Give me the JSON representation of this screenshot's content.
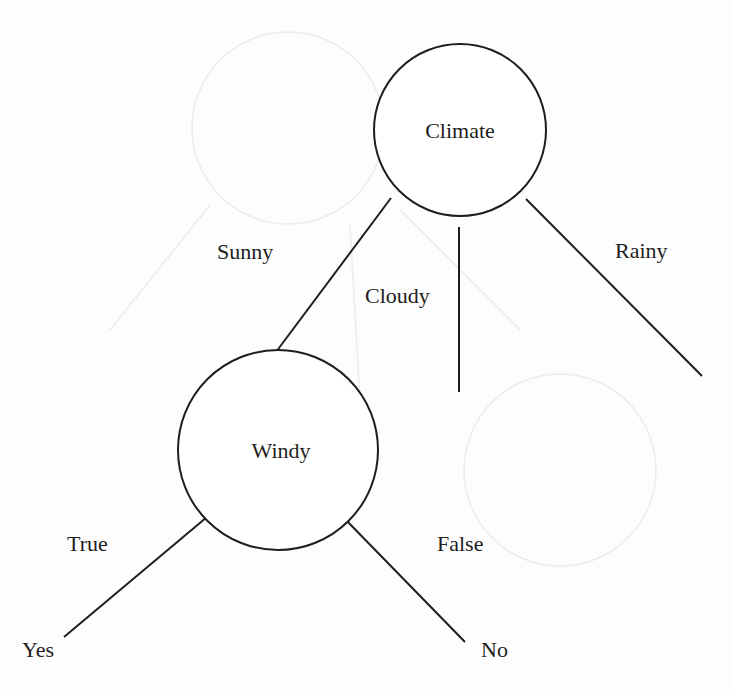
{
  "diagram": {
    "type": "decision-tree",
    "colors": {
      "stroke": "#1e1e1e",
      "text": "#1e1e1e",
      "background": "#fdfdfd"
    },
    "nodes": {
      "root": {
        "label": "Climate",
        "cx": 460,
        "cy": 130,
        "r": 86
      },
      "windy": {
        "label": "Windy",
        "cx": 278,
        "cy": 450,
        "r": 100
      }
    },
    "edges": {
      "sunny": {
        "label": "Sunny",
        "from": "Climate",
        "to": "Windy",
        "x1": 391,
        "y1": 198,
        "x2": 276,
        "y2": 352,
        "label_x": 217,
        "label_y": 259
      },
      "cloudy": {
        "label": "Cloudy",
        "from": "Climate",
        "to": "",
        "x1": 459,
        "y1": 227,
        "x2": 459,
        "y2": 392,
        "label_x": 365,
        "label_y": 303
      },
      "rainy": {
        "label": "Rainy",
        "from": "Climate",
        "to": "",
        "x1": 526,
        "y1": 199,
        "x2": 702,
        "y2": 376,
        "label_x": 615,
        "label_y": 258
      },
      "true": {
        "label": "True",
        "from": "Windy",
        "to": "Yes",
        "x1": 207,
        "y1": 517,
        "x2": 64,
        "y2": 637,
        "label_x": 67,
        "label_y": 551
      },
      "false": {
        "label": "False",
        "from": "Windy",
        "to": "No",
        "x1": 343,
        "y1": 517,
        "x2": 465,
        "y2": 642,
        "label_x": 437,
        "label_y": 551
      }
    },
    "leaves": {
      "yes": {
        "label": "Yes",
        "x": 22,
        "y": 657
      },
      "no": {
        "label": "No",
        "x": 481,
        "y": 657
      }
    }
  }
}
